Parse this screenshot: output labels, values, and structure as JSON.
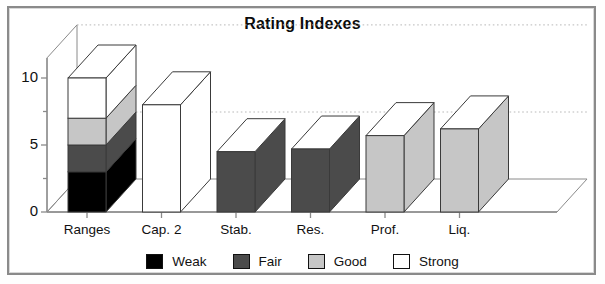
{
  "chart_data": {
    "type": "bar",
    "title": "Rating Indexes",
    "subtitle": "",
    "xlabel": "",
    "ylabel": "",
    "ylim": [
      0,
      11.5
    ],
    "yticks": [
      0,
      5,
      10
    ],
    "ytick_labels": [
      "0",
      "5",
      "10"
    ],
    "yminor_ticks": [
      2.5,
      7.5
    ],
    "grid": true,
    "gridlines_at": [
      5,
      11.5
    ],
    "style": "3d-bars",
    "legend_position": "bottom",
    "categories": [
      "Ranges",
      "Cap. 2",
      "Stab.",
      "Res.",
      "Prof.",
      "Liq."
    ],
    "legend": [
      {
        "name": "Weak",
        "color": "#000000"
      },
      {
        "name": "Fair",
        "color": "#4b4b4b"
      },
      {
        "name": "Good",
        "color": "#c6c6c6"
      },
      {
        "name": "Strong",
        "color": "#ffffff"
      }
    ],
    "bars": [
      {
        "category": "Ranges",
        "stacked": true,
        "value": 10,
        "segments": [
          {
            "name": "Weak",
            "from": 0,
            "to": 3,
            "value": 3,
            "color": "#000000"
          },
          {
            "name": "Fair",
            "from": 3,
            "to": 5,
            "value": 2,
            "color": "#4b4b4b"
          },
          {
            "name": "Good",
            "from": 5,
            "to": 7,
            "value": 2,
            "color": "#c6c6c6"
          },
          {
            "name": "Strong",
            "from": 7,
            "to": 10,
            "value": 3,
            "color": "#ffffff"
          }
        ]
      },
      {
        "category": "Cap. 2",
        "stacked": false,
        "value": 8,
        "rating": "Strong",
        "color": "#ffffff"
      },
      {
        "category": "Stab.",
        "stacked": false,
        "value": 4.5,
        "rating": "Fair",
        "color": "#4b4b4b"
      },
      {
        "category": "Res.",
        "stacked": false,
        "value": 4.7,
        "rating": "Fair",
        "color": "#4b4b4b"
      },
      {
        "category": "Prof.",
        "stacked": false,
        "value": 5.7,
        "rating": "Good",
        "color": "#c6c6c6"
      },
      {
        "category": "Liq.",
        "stacked": false,
        "value": 6.2,
        "rating": "Good",
        "color": "#c6c6c6"
      }
    ]
  },
  "axis": {
    "y_labels": [
      "10",
      "5",
      "0"
    ]
  },
  "colors": {
    "frame": "#8a8a8a",
    "axis": "#8a8a8a",
    "grid": "#b9b9b9",
    "outline": "#3a3a3a",
    "text": "#111111"
  }
}
